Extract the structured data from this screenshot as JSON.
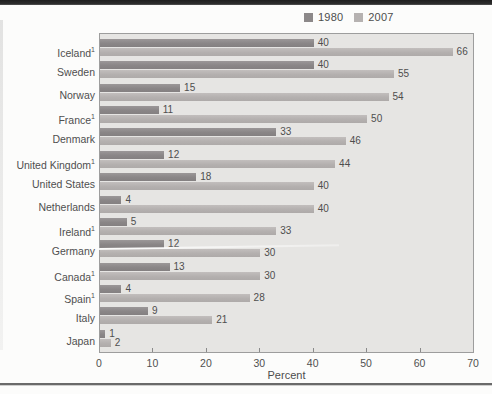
{
  "legend": {
    "items": [
      {
        "label": "1980",
        "color": "#8c8889"
      },
      {
        "label": "2007",
        "color": "#b6b2b1"
      }
    ]
  },
  "chart_data": {
    "type": "bar",
    "orientation": "horizontal",
    "title": "",
    "xlabel": "Percent",
    "ylabel": "",
    "xlim": [
      0,
      70
    ],
    "xticks": [
      0,
      10,
      20,
      30,
      40,
      50,
      60,
      70
    ],
    "grid": false,
    "legend_position": "top-right",
    "categories": [
      {
        "label": "Iceland",
        "footnote": "1"
      },
      {
        "label": "Sweden",
        "footnote": ""
      },
      {
        "label": "Norway",
        "footnote": ""
      },
      {
        "label": "France",
        "footnote": "1"
      },
      {
        "label": "Denmark",
        "footnote": ""
      },
      {
        "label": "United Kingdom",
        "footnote": "1"
      },
      {
        "label": "United States",
        "footnote": ""
      },
      {
        "label": "Netherlands",
        "footnote": ""
      },
      {
        "label": "Ireland",
        "footnote": "1"
      },
      {
        "label": "Germany",
        "footnote": ""
      },
      {
        "label": "Canada",
        "footnote": "1"
      },
      {
        "label": "Spain",
        "footnote": "1"
      },
      {
        "label": "Italy",
        "footnote": ""
      },
      {
        "label": "Japan",
        "footnote": ""
      }
    ],
    "series": [
      {
        "name": "1980",
        "color": "#8c8889",
        "values": [
          40,
          40,
          15,
          11,
          33,
          12,
          18,
          4,
          5,
          12,
          13,
          4,
          9,
          1
        ]
      },
      {
        "name": "2007",
        "color": "#b6b2b1",
        "values": [
          66,
          55,
          54,
          50,
          46,
          44,
          40,
          40,
          33,
          30,
          30,
          28,
          21,
          2
        ]
      }
    ]
  },
  "colors": {
    "plot_background": "#e6e5e3",
    "plot_border": "#9d9d9d",
    "text": "#4d4d4d",
    "page_background": "#fcfcfb"
  }
}
